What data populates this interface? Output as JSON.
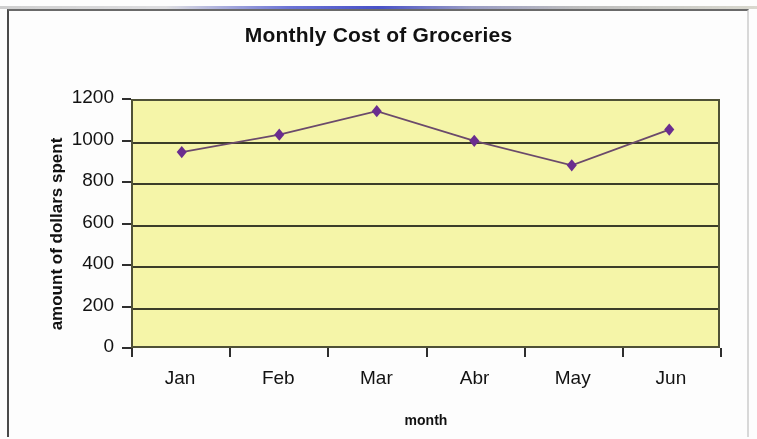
{
  "document": {
    "background_color": "#fdfdfd",
    "frame_color": "#4a4a4a",
    "scan_streak_color": "#2832be"
  },
  "chart_data": {
    "type": "line",
    "title": "Monthly Cost of Groceries",
    "xlabel": "month",
    "ylabel": "amount of dollars spent",
    "categories": [
      "Jan",
      "Feb",
      "Mar",
      "Abr",
      "May",
      "Jun"
    ],
    "values": [
      950,
      1035,
      1150,
      1005,
      885,
      1060
    ],
    "series": [
      {
        "name": "amount of dollars spent",
        "values": [
          950,
          1035,
          1150,
          1005,
          885,
          1060
        ]
      }
    ],
    "ylim": [
      0,
      1200
    ],
    "ytick_labels": [
      "0",
      "200",
      "400",
      "600",
      "800",
      "1000",
      "1200"
    ],
    "ytick_values": [
      0,
      200,
      400,
      600,
      800,
      1000,
      1200
    ],
    "grid": true,
    "grid_axis": "y",
    "legend": false,
    "legend_position": "none",
    "plot_background_color": "#f5f5a8",
    "plot_border_color": "#4f5136",
    "gridline_color": "#3b3d28",
    "line_color": "#6b4a6b",
    "marker_color": "#6a2d8f",
    "marker_shape": "diamond"
  }
}
